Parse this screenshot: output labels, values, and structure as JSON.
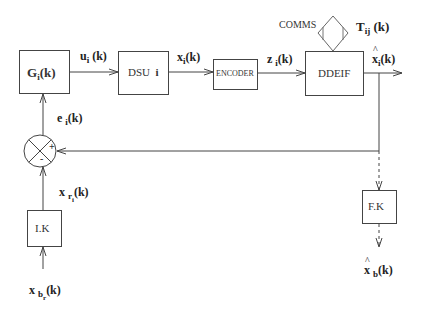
{
  "diagram": {
    "type": "block-diagram",
    "blocks": [
      {
        "id": "G",
        "label": "G",
        "sub": "i",
        "suffix": "(k)"
      },
      {
        "id": "DSU",
        "label": "DSU",
        "suffix": "i"
      },
      {
        "id": "ENCODER",
        "label": "ENCODER"
      },
      {
        "id": "DDEIF",
        "label": "DDEIF"
      },
      {
        "id": "FK",
        "label": "F.K"
      },
      {
        "id": "IK",
        "label": "I.K"
      }
    ],
    "comms": {
      "label": "COMMS",
      "signal": "T",
      "signal_sub": "ij",
      "signal_suffix": "(k)"
    },
    "summing_junction": {
      "plus": "+",
      "minus": "-"
    },
    "signals": {
      "u": {
        "base": "u",
        "sub": "i",
        "suffix": "(k)"
      },
      "x": {
        "base": "x",
        "sub": "i",
        "suffix": "(k)"
      },
      "z": {
        "base": "z",
        "sub": "i",
        "suffix": "(k)"
      },
      "xhat": {
        "base": "x",
        "sub": "i",
        "suffix": "(k)"
      },
      "e": {
        "base": "e",
        "sub": "i",
        "suffix": "(k)"
      },
      "xr": {
        "base": "x",
        "sub": "r",
        "subsub": "i",
        "suffix": "(k)"
      },
      "xb": {
        "base": "x",
        "sub": "b",
        "subsub": "r",
        "suffix": "(k)"
      },
      "xhatb": {
        "base": "x",
        "sub": "b",
        "suffix": "(k)"
      }
    }
  }
}
